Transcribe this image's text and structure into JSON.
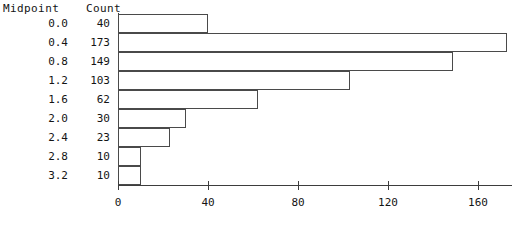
{
  "header": {
    "midpoint_label": "Midpoint",
    "count_label": "Count"
  },
  "chart_data": {
    "type": "bar",
    "orientation": "horizontal",
    "title": "",
    "xlabel": "",
    "ylabel": "",
    "categories": [
      "0.0",
      "0.4",
      "0.8",
      "1.2",
      "1.6",
      "2.0",
      "2.4",
      "2.8",
      "3.2"
    ],
    "values": [
      40,
      173,
      149,
      103,
      62,
      30,
      23,
      10,
      10
    ],
    "xlim": [
      0,
      175
    ],
    "xticks": [
      0,
      40,
      80,
      120,
      160
    ],
    "xtick_labels": [
      "0",
      "40",
      "80",
      "120",
      "160"
    ],
    "grid": false,
    "legend": null,
    "bar_fill": "#ffffff",
    "bar_edge": "#4a4a4a",
    "axis_color": "#3d3d3d"
  }
}
